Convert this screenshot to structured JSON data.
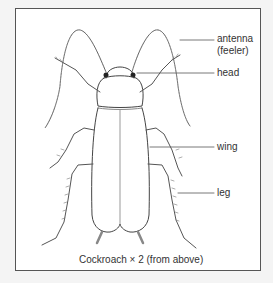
{
  "figure": {
    "labels": {
      "antenna": "antenna",
      "antenna_sub": "(feeler)",
      "head": "head",
      "wing": "wing",
      "leg": "leg"
    },
    "caption": "Cockroach × 2 (from above)"
  }
}
